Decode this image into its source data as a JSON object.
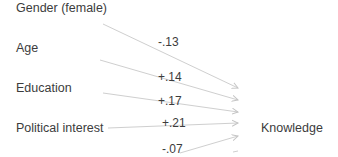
{
  "diagram": {
    "predictors": [
      {
        "label": "Gender (female)"
      },
      {
        "label": "Age"
      },
      {
        "label": "Education"
      },
      {
        "label": "Political interest"
      }
    ],
    "outcome": {
      "label": "Knowledge"
    },
    "paths": [
      {
        "from": "Gender (female)",
        "to": "Knowledge",
        "coefficient": "-.13"
      },
      {
        "from": "Age",
        "to": "Knowledge",
        "coefficient": "+.14"
      },
      {
        "from": "Education",
        "to": "Knowledge",
        "coefficient": "+.17"
      },
      {
        "from": "Political interest",
        "to": "Knowledge",
        "coefficient": "+.21"
      },
      {
        "from": "(below)",
        "to": "Knowledge",
        "coefficient": "-.07"
      }
    ],
    "colors": {
      "line": "#c8c8c8",
      "text": "#3c3c3c"
    }
  }
}
